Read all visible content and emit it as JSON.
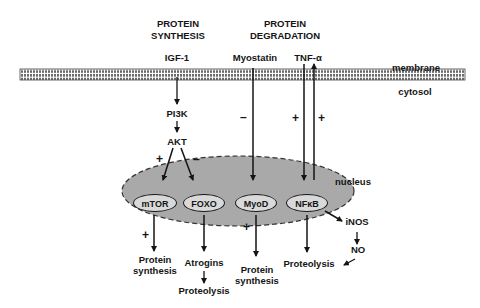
{
  "headers": {
    "synthesis": "PROTEIN\nSYNTHESIS",
    "synthesis_line1": "PROTEIN",
    "synthesis_line2": "SYNTHESIS",
    "degradation_line1": "PROTEIN",
    "degradation_line2": "DEGRADATION"
  },
  "compartments": {
    "membrane": "membrane",
    "cytosol": "cytosol",
    "nucleus": "nucleus"
  },
  "ligands": {
    "igf1": "IGF-1",
    "myostatin": "Myostatin",
    "tnfa": "TNF-α"
  },
  "signaling": {
    "pi3k": "PI3K",
    "akt": "AKT"
  },
  "nuclear_factors": [
    {
      "id": "mtor",
      "label": "mTOR"
    },
    {
      "id": "foxo",
      "label": "FOXO"
    },
    {
      "id": "myod",
      "label": "MyoD"
    },
    {
      "id": "nfkb",
      "label": "NFκB"
    }
  ],
  "outcomes": {
    "mtor_out_line1": "Protein",
    "mtor_out_line2": "synthesis",
    "atrogins": "Atrogins",
    "foxo_proteolysis": "Proteolysis",
    "myod_out_line1": "Protein",
    "myod_out_line2": "synthesis",
    "nfkb_proteolysis": "Proteolysis",
    "inos": "iNOS",
    "no": "NO"
  },
  "signs": {
    "akt_mtor": "+",
    "akt_foxo": "–",
    "myostatin": "–",
    "tnf_in": "+",
    "tnf_out": "+",
    "mtor_out": "+",
    "myod_out": "+"
  },
  "colors": {
    "nucleus_fill": "#a9a9a9",
    "node_fill": "#d9d9d9",
    "ink": "#151515"
  }
}
